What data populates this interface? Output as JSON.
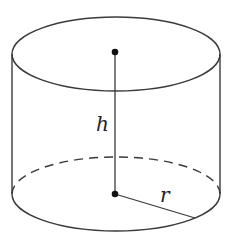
{
  "diagram": {
    "type": "cylinder",
    "labels": {
      "height": "h",
      "radius": "r"
    },
    "geometry": {
      "center_x": 116,
      "rx": 104,
      "ry": 37,
      "top_center_y": 54,
      "bottom_center_y": 194,
      "radius_end_x": 195,
      "radius_end_y": 218
    },
    "colors": {
      "stroke": "#3a3a3a",
      "dot": "#111111",
      "background": "#ffffff"
    }
  }
}
